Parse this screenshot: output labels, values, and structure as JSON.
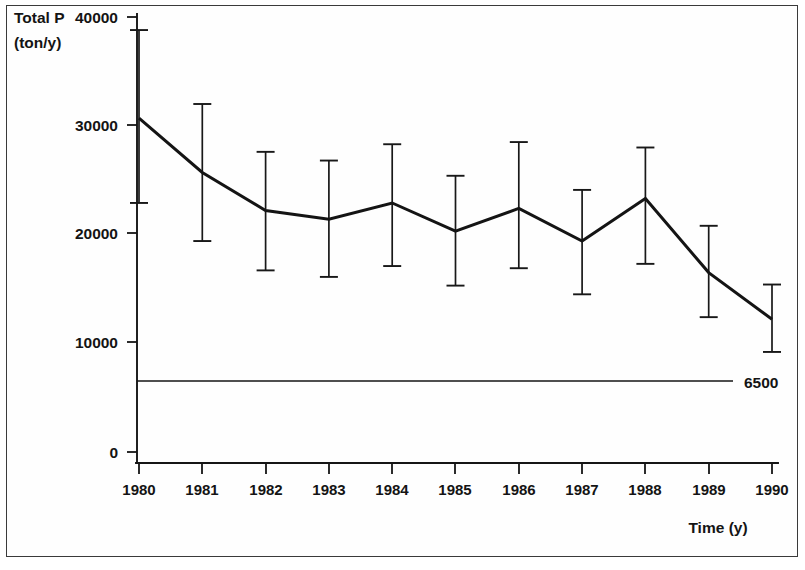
{
  "figure": {
    "frame_color": "#3a3a3a",
    "line_color": "#141414",
    "background": "#ffffff"
  },
  "axes": {
    "y_title_line1": "Total P",
    "y_title_line2": "(ton/y)",
    "x_title": "Time (y)",
    "y_ticks": [
      "40000",
      "30000",
      "20000",
      "10000",
      "0"
    ],
    "x_ticks": [
      "1980",
      "1981",
      "1982",
      "1983",
      "1984",
      "1985",
      "1986",
      "1987",
      "1988",
      "1989",
      "1990"
    ]
  },
  "annotations": {
    "reference_line_label": "6500"
  },
  "chart_data": {
    "type": "line",
    "title": "",
    "xlabel": "Time (y)",
    "ylabel": "Total P (ton/y)",
    "xlim": [
      1980,
      1990
    ],
    "ylim": [
      0,
      40000
    ],
    "ytick_values": [
      0,
      10000,
      20000,
      30000,
      40000
    ],
    "grid": false,
    "legend": false,
    "x": [
      1980,
      1981,
      1982,
      1983,
      1984,
      1985,
      1986,
      1987,
      1988,
      1989,
      1990
    ],
    "series": [
      {
        "name": "Total P",
        "values": [
          30700,
          25700,
          22200,
          21400,
          22900,
          20300,
          22400,
          19400,
          23300,
          16500,
          12200
        ],
        "err_low": [
          22900,
          19400,
          16700,
          16100,
          17100,
          15300,
          16900,
          14500,
          17300,
          12400,
          9200
        ],
        "err_high": [
          38800,
          32000,
          27600,
          26800,
          28300,
          25400,
          28500,
          24100,
          28000,
          20800,
          15400
        ]
      }
    ],
    "reference_lines": [
      {
        "label": "6500",
        "value": 6500,
        "orientation": "horizontal"
      }
    ]
  }
}
